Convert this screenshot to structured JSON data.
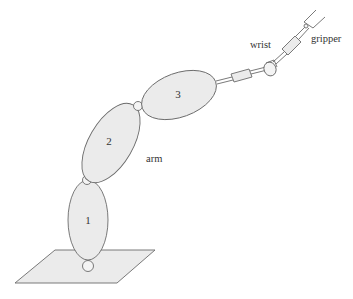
{
  "diagram": {
    "type": "robot-arm-schematic",
    "labels": {
      "wrist": "wrist",
      "gripper": "gripper",
      "arm": "arm"
    },
    "segments": [
      {
        "id": "segment-1",
        "label": "1"
      },
      {
        "id": "segment-2",
        "label": "2"
      },
      {
        "id": "segment-3",
        "label": "3"
      }
    ],
    "colors": {
      "fill": "#ebebeb",
      "stroke": "#6b6b6b",
      "text": "#333333",
      "background": "#ffffff"
    }
  }
}
